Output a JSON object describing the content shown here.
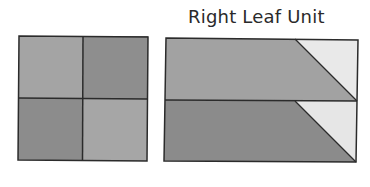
{
  "title": "Right Leaf Unit",
  "colors": {
    "light_gray": "#a3a3a3",
    "dark_gray": "#8c8c8c",
    "pale": "#e8e8e8",
    "stroke": "#2b2b2b",
    "background": "#ffffff"
  },
  "left_block": {
    "description": "Four-patch square",
    "cells": [
      {
        "position": "top-left",
        "shade": "light"
      },
      {
        "position": "top-right",
        "shade": "dark"
      },
      {
        "position": "bottom-left",
        "shade": "dark"
      },
      {
        "position": "bottom-right",
        "shade": "light"
      }
    ]
  },
  "right_block": {
    "description": "Two stacked strips each with a diagonal-cut pale triangle at right end",
    "strips": [
      {
        "position": "top",
        "main_shade": "light",
        "corner_shade": "pale"
      },
      {
        "position": "bottom",
        "main_shade": "dark",
        "corner_shade": "pale"
      }
    ]
  }
}
